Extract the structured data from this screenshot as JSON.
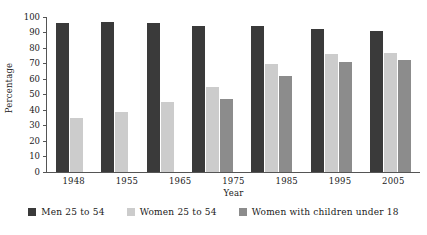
{
  "chart_data": {
    "type": "bar",
    "title": "",
    "xlabel": "Year",
    "ylabel": "Percentage",
    "categories": [
      "1948",
      "1955",
      "1965",
      "1975",
      "1985",
      "1995",
      "2005"
    ],
    "ylim": [
      0,
      100
    ],
    "yticks": [
      0,
      10,
      20,
      30,
      40,
      50,
      60,
      70,
      80,
      90,
      100
    ],
    "grid": false,
    "legend_position": "bottom",
    "series": [
      {
        "name": "Men 25 to 54",
        "color": "#3a3a3a",
        "values": [
          96,
          97,
          96,
          94,
          94,
          92,
          91
        ]
      },
      {
        "name": "Women 25 to 54",
        "color": "#cccccc",
        "values": [
          35,
          39,
          45,
          55,
          70,
          76,
          77
        ]
      },
      {
        "name": "Women with children under 18",
        "color": "#8c8c8c",
        "values": [
          null,
          null,
          null,
          47,
          62,
          71,
          72
        ]
      }
    ]
  }
}
